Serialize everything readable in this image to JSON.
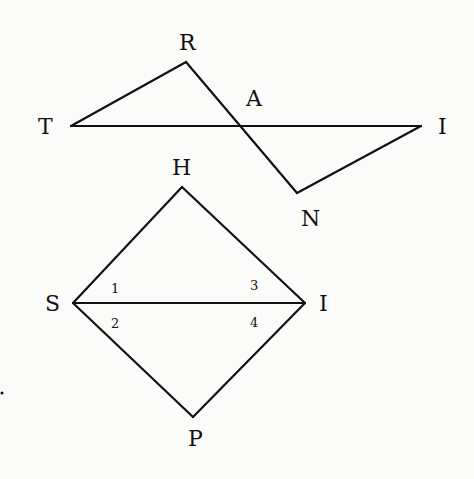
{
  "figure1": {
    "points": {
      "T": {
        "x": 71,
        "y": 126,
        "label": "T",
        "lx": 38,
        "ly": 134
      },
      "R": {
        "x": 186,
        "y": 62,
        "label": "R",
        "lx": 179,
        "ly": 50
      },
      "A": {
        "x": 239,
        "y": 126,
        "label": "A",
        "lx": 246,
        "ly": 106
      },
      "I": {
        "x": 421,
        "y": 126,
        "label": "I",
        "lx": 438,
        "ly": 134
      },
      "N": {
        "x": 297,
        "y": 193,
        "label": "N",
        "lx": 301,
        "ly": 226
      }
    },
    "segments": [
      [
        "T",
        "R"
      ],
      [
        "R",
        "N"
      ],
      [
        "T",
        "I"
      ],
      [
        "I",
        "N"
      ]
    ]
  },
  "figure2": {
    "points": {
      "H": {
        "x": 182,
        "y": 187,
        "label": "H",
        "lx": 172,
        "ly": 175
      },
      "S": {
        "x": 73,
        "y": 303,
        "label": "S",
        "lx": 45,
        "ly": 311
      },
      "I": {
        "x": 305,
        "y": 303,
        "label": "I",
        "lx": 319,
        "ly": 311
      },
      "P": {
        "x": 193,
        "y": 417,
        "label": "P",
        "lx": 188,
        "ly": 446
      }
    },
    "segments": [
      [
        "S",
        "H"
      ],
      [
        "H",
        "I"
      ],
      [
        "S",
        "I"
      ],
      [
        "S",
        "P"
      ],
      [
        "P",
        "I"
      ]
    ],
    "angle_labels": [
      {
        "text": "1",
        "x": 111,
        "y": 293
      },
      {
        "text": "2",
        "x": 111,
        "y": 328
      },
      {
        "text": "3",
        "x": 250,
        "y": 290
      },
      {
        "text": "4",
        "x": 250,
        "y": 327
      }
    ]
  },
  "colors": {
    "ink": "#111111",
    "paper": "#fbfbfa"
  }
}
